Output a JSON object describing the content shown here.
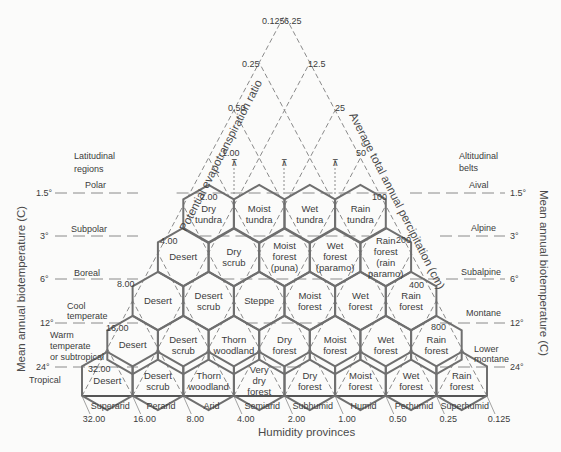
{
  "colors": {
    "line": "#8a8a8a",
    "hex": "#6f6f6f",
    "text": "#3c3c3c",
    "background": "#fbfbfa"
  },
  "axes": {
    "left_diagonal_title": "Potential evapotranspiration ratio",
    "right_diagonal_title": "Average total annual percipitation (cm)",
    "bottom_title": "Humidity provinces",
    "left_vertical_title": "Mean annual biotemperature (C)",
    "right_vertical_title": "Mean annual biotemperature (C)"
  },
  "pet_ratio_ticks": [
    "32.00",
    "16.00",
    "8.00",
    "4.00",
    "2.00",
    "1.00",
    "0.50",
    "0.25",
    "0.125"
  ],
  "precip_ticks": [
    "6.25",
    "12.5",
    "25",
    "50",
    "100",
    "200",
    "400",
    "800"
  ],
  "bottom_ticks": [
    "32.00",
    "16.00",
    "8.00",
    "4.00",
    "2.00",
    "1.00",
    "0.50",
    "0.25",
    "0.125"
  ],
  "humidity_provinces": [
    "Superarid",
    "Perarid",
    "Arid",
    "Semiarid",
    "Subhumid",
    "Humid",
    "Perhumid",
    "Superhumid"
  ],
  "temperature_ticks": [
    "1.5°",
    "3°",
    "6°",
    "12°",
    "24°"
  ],
  "latitudinal": {
    "title": [
      "Latitudinal",
      "regions"
    ],
    "regions": [
      "Polar",
      "Subpolar",
      "Boreal",
      "Cool temperate",
      "Warm temperate or subtropical",
      "Tropical"
    ]
  },
  "altitudinal": {
    "title": [
      "Altitudinal",
      "belts"
    ],
    "belts": [
      "Aival",
      "Alpine",
      "Subalpine",
      "Montane",
      "Lower montane"
    ]
  },
  "zones": [
    [
      [
        "Dry",
        "tundra"
      ],
      [
        "Moist",
        "tundra"
      ],
      [
        "Wet",
        "tundra"
      ],
      [
        "Rain",
        "tundra"
      ]
    ],
    [
      [
        "Desert"
      ],
      [
        "Dry",
        "scrub"
      ],
      [
        "Moist",
        "forest",
        "(puna)"
      ],
      [
        "Wet",
        "forest",
        "(paramo)"
      ],
      [
        "Rain",
        "forest",
        "(rain",
        "paramo)"
      ]
    ],
    [
      [
        "Desert"
      ],
      [
        "Desert",
        "scrub"
      ],
      [
        "Steppe"
      ],
      [
        "Moist",
        "forest"
      ],
      [
        "Wet",
        "forest"
      ],
      [
        "Rain",
        "forest"
      ]
    ],
    [
      [
        "Desert"
      ],
      [
        "Desert",
        "scrub"
      ],
      [
        "Thorn",
        "woodland"
      ],
      [
        "Dry",
        "forest"
      ],
      [
        "Moist",
        "forest"
      ],
      [
        "Wet",
        "forest"
      ],
      [
        "Rain",
        "forest"
      ]
    ],
    [
      [
        "Desert"
      ],
      [
        "Desert",
        "scrub"
      ],
      [
        "Thorn",
        "woodland"
      ],
      [
        "Very",
        "dry",
        "forest"
      ],
      [
        "Dry",
        "forest"
      ],
      [
        "Moist",
        "forest"
      ],
      [
        "Wet",
        "forest"
      ],
      [
        "Rain",
        "forest"
      ]
    ]
  ]
}
